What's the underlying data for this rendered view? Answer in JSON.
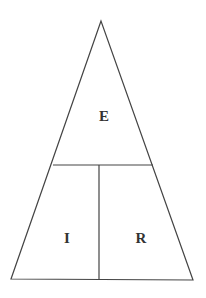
{
  "diagram": {
    "type": "ohms-law-triangle",
    "top_label": "E",
    "bottom_left_label": "I",
    "bottom_right_label": "R",
    "line_color": "#444444",
    "text_color": "#333333"
  }
}
